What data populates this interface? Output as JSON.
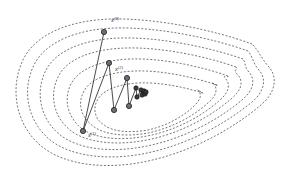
{
  "figure": {
    "title": "",
    "background_color": "#ffffff",
    "width": 283,
    "height": 178
  },
  "chart_data": {
    "type": "line",
    "title": "",
    "subtitle": "",
    "xlabel": "",
    "ylabel": "",
    "grid": false,
    "legend": "none",
    "axes_visible": false,
    "xlim": [
      0,
      283
    ],
    "ylim": [
      178,
      0
    ],
    "contours": {
      "style": "dashed",
      "color": "#4a4a4a",
      "dash_pattern": "2 1.7",
      "line_width": 0.75,
      "count": 7,
      "shape": "teardrop-banana pointing right",
      "levels": [
        7,
        6,
        5,
        4,
        3,
        2,
        1
      ],
      "paths": [
        "M 252 44 C 214 30, 156 18, 112 19 C 70 20, 34 34, 22 62 C 10 90, 16 124, 40 145 C 64 166, 108 170, 148 161 C 190 152, 232 130, 262 104 C 276 92, 278 76, 268 66 C 262 59, 258 50, 252 44 Z",
        "M 248 51 C 212 38, 158 27, 116 28 C 77 29, 44 42, 33 67 C 22 92, 28 121, 49 139 C 70 157, 110 161, 147 153 C 186 145, 224 125, 252 102 C 265 91, 267 78, 258 69 C 253 63, 253 57, 248 51 Z",
        "M 243 59 C 209 47, 159 37, 121 38 C 85 39, 55 50, 45 72 C 35 94, 41 119, 59 134 C 78 150, 113 153, 147 146 C 182 139, 217 121, 242 100 C 254 90, 256 79, 248 71 C 244 66, 246 63, 243 59 Z",
        "M 236 67 C 205 56, 160 47, 126 48 C 94 49, 67 58, 58 77 C 49 96, 54 117, 70 130 C 86 143, 117 146, 147 140 C 178 134, 209 118, 231 99 C 242 90, 244 81, 237 74 C 233 70, 238 70, 236 67 Z",
        "M 228 76 C 200 66, 161 58, 131 59 C 103 60, 79 68, 71 84 C 63 100, 68 117, 81 128 C 95 139, 121 141, 147 136 C 174 131, 201 117, 220 100 C 229 92, 231 84, 225 78 C 222 75, 229 78, 228 76 Z",
        "M 217 85 C 193 77, 161 70, 135 71 C 111 72, 91 78, 84 91 C 77 104, 81 117, 93 126 C 104 135, 126 137, 148 133 C 171 128, 193 117, 209 102 C 217 95, 218 88, 213 83 C 210 81, 218 87, 217 85 Z",
        "M 203 93 C 184 87, 159 82, 139 83 C 120 84, 104 89, 98 99 C 92 109, 95 119, 104 125 C 113 132, 130 133, 148 130 C 166 126, 183 117, 195 105 C 201 99, 202 94, 198 90 C 196 89, 204 94, 203 93 Z"
      ]
    },
    "trajectory": {
      "name": "iterate path",
      "color": "#2b2b2b",
      "line_width": 0.85,
      "marker": "circle",
      "marker_color": "#6e6e6e",
      "points": [
        {
          "index": 0,
          "x": 104,
          "y": 32,
          "label": "x",
          "superscript": "(0)",
          "label_x": 111,
          "label_y": 22,
          "labeled": true
        },
        {
          "index": 1,
          "x": 83,
          "y": 131,
          "label": "x",
          "superscript": "(1)",
          "label_x": 88,
          "label_y": 137,
          "labeled": true
        },
        {
          "index": 2,
          "x": 109,
          "y": 63,
          "label": "x",
          "superscript": "(2)",
          "label_x": 115,
          "label_y": 71,
          "labeled": true
        },
        {
          "index": 3,
          "x": 114,
          "y": 110,
          "label": "x",
          "superscript": "(3)",
          "label_x": 0,
          "label_y": 0,
          "labeled": false
        },
        {
          "index": 4,
          "x": 127,
          "y": 78,
          "label": "x",
          "superscript": "(4)",
          "label_x": 0,
          "label_y": 0,
          "labeled": false
        },
        {
          "index": 5,
          "x": 129,
          "y": 106,
          "label": "x",
          "superscript": "(5)",
          "label_x": 0,
          "label_y": 0,
          "labeled": false
        },
        {
          "index": 6,
          "x": 136,
          "y": 88,
          "label": "x",
          "superscript": "(6)",
          "label_x": 0,
          "label_y": 0,
          "labeled": false
        },
        {
          "index": 7,
          "x": 137,
          "y": 97,
          "label": "x",
          "superscript": "(7)",
          "label_x": 0,
          "label_y": 0,
          "labeled": false
        },
        {
          "index": 8,
          "x": 141,
          "y": 90,
          "label": "x",
          "superscript": "(8)",
          "label_x": 0,
          "label_y": 0,
          "labeled": false
        },
        {
          "index": 9,
          "x": 142,
          "y": 95,
          "label": "x",
          "superscript": "(9)",
          "label_x": 0,
          "label_y": 0,
          "labeled": false
        },
        {
          "index": 10,
          "x": 144,
          "y": 91,
          "label": "x",
          "superscript": "(10)",
          "label_x": 0,
          "label_y": 0,
          "labeled": false
        },
        {
          "index": 11,
          "x": 145,
          "y": 94,
          "label": "x",
          "superscript": "(11)",
          "label_x": 0,
          "label_y": 0,
          "labeled": false
        },
        {
          "index": 12,
          "x": 146,
          "y": 92,
          "label": "x",
          "superscript": "(12)",
          "label_x": 0,
          "label_y": 0,
          "labeled": false
        }
      ]
    },
    "labels": [
      {
        "id": "label-x0",
        "text": "x",
        "superscript": "(0)",
        "x": 111,
        "y": 22
      },
      {
        "id": "label-x1",
        "text": "x",
        "superscript": "(1)",
        "x": 88,
        "y": 137
      },
      {
        "id": "label-x2",
        "text": "x",
        "superscript": "(2)",
        "x": 115,
        "y": 71
      }
    ]
  }
}
